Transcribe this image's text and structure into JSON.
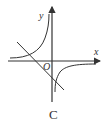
{
  "figure": {
    "caption": "C",
    "axes": {
      "x_label": "x",
      "y_label": "y",
      "origin_label": "O"
    },
    "elements": [
      {
        "type": "hyperbola",
        "description": "branches in quadrants II and IV (y = k/x, k<0)"
      },
      {
        "type": "line",
        "description": "decreasing line passing through quadrants II, III, IV"
      }
    ],
    "colors": {
      "stroke": "#333333",
      "background": "#ffffff"
    }
  }
}
